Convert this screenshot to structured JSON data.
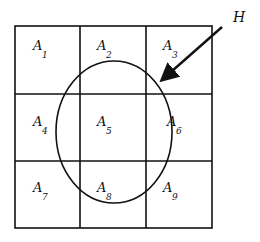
{
  "diagram": {
    "type": "partition-grid-with-event",
    "grid": {
      "rows": 3,
      "cols": 3,
      "cells": [
        {
          "label": "A",
          "subscript": "1"
        },
        {
          "label": "A",
          "subscript": "2"
        },
        {
          "label": "A",
          "subscript": "3"
        },
        {
          "label": "A",
          "subscript": "4"
        },
        {
          "label": "A",
          "subscript": "5"
        },
        {
          "label": "A",
          "subscript": "6"
        },
        {
          "label": "A",
          "subscript": "7"
        },
        {
          "label": "A",
          "subscript": "8"
        },
        {
          "label": "A",
          "subscript": "9"
        }
      ]
    },
    "event": {
      "label": "H",
      "shape": "ellipse"
    },
    "colors": {
      "stroke": "#111111",
      "background": "#ffffff"
    }
  }
}
